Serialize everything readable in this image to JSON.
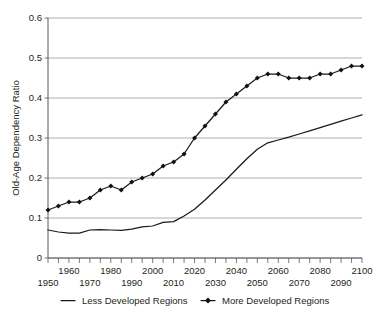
{
  "chart_data": {
    "type": "line",
    "title": "",
    "xlabel": "",
    "ylabel": "Old-Age Dependency Ratio",
    "xlim": [
      1950,
      2100
    ],
    "ylim": [
      0,
      0.6
    ],
    "grid": true,
    "legend_position": "bottom",
    "y_ticks": [
      "0",
      "0.1",
      "0.2",
      "0.3",
      "0.4",
      "0.5",
      "0.6"
    ],
    "y_tick_values": [
      0,
      0.1,
      0.2,
      0.3,
      0.4,
      0.5,
      0.6
    ],
    "x_ticks_upper": [
      "1960",
      "1980",
      "2000",
      "2020",
      "2040",
      "2060",
      "2080",
      "2100"
    ],
    "x_ticks_lower": [
      "1950",
      "1970",
      "1990",
      "2010",
      "2030",
      "2050",
      "2070",
      "2090"
    ],
    "x_tick_values_upper": [
      1960,
      1980,
      2000,
      2020,
      2040,
      2060,
      2080,
      2100
    ],
    "x_tick_values_lower": [
      1950,
      1970,
      1990,
      2010,
      2030,
      2050,
      2070,
      2090
    ],
    "x_minor_ticks": [
      1950,
      1955,
      1960,
      1965,
      1970,
      1975,
      1980,
      1985,
      1990,
      1995,
      2000,
      2005,
      2010,
      2015,
      2020,
      2025,
      2030,
      2035,
      2040,
      2045,
      2050,
      2055,
      2060,
      2065,
      2070,
      2075,
      2080,
      2085,
      2090,
      2095,
      2100
    ],
    "x": [
      1950,
      1955,
      1960,
      1965,
      1970,
      1975,
      1980,
      1985,
      1990,
      1995,
      2000,
      2005,
      2010,
      2015,
      2020,
      2025,
      2030,
      2035,
      2040,
      2045,
      2050,
      2055,
      2060,
      2065,
      2070,
      2075,
      2080,
      2085,
      2090,
      2095,
      2100
    ],
    "series": [
      {
        "name": "Less Developed Regions",
        "marker": "none",
        "color": "#1a1a1a",
        "values": [
          0.07,
          0.065,
          0.062,
          0.062,
          0.07,
          0.071,
          0.07,
          0.069,
          0.072,
          0.078,
          0.08,
          0.089,
          0.091,
          0.105,
          0.122,
          0.145,
          0.17,
          0.195,
          0.222,
          0.248,
          0.272,
          0.288,
          0.295,
          0.302,
          0.31,
          0.318,
          0.326,
          0.334,
          0.342,
          0.35,
          0.358
        ]
      },
      {
        "name": "More Developed Regions",
        "marker": "diamond",
        "color": "#111111",
        "values": [
          0.12,
          0.13,
          0.14,
          0.14,
          0.15,
          0.17,
          0.18,
          0.17,
          0.19,
          0.2,
          0.21,
          0.23,
          0.24,
          0.26,
          0.3,
          0.33,
          0.36,
          0.39,
          0.41,
          0.43,
          0.45,
          0.46,
          0.46,
          0.45,
          0.45,
          0.45,
          0.46,
          0.46,
          0.47,
          0.48,
          0.48
        ]
      }
    ]
  },
  "legend": {
    "items": [
      {
        "label": "Less Developed Regions",
        "style": "line"
      },
      {
        "label": "More Developed Regions",
        "style": "line-diamond"
      }
    ]
  },
  "caption": {
    "text": ""
  }
}
